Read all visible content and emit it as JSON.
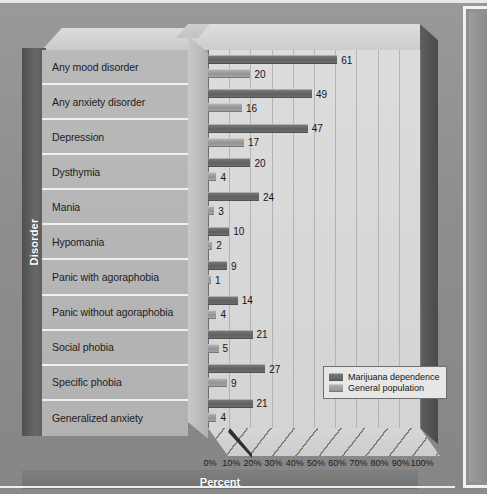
{
  "chart_data": {
    "type": "bar",
    "orientation": "horizontal",
    "title": "",
    "xlabel": "Percent",
    "ylabel": "Disorder",
    "xlim": [
      0,
      100
    ],
    "xticks": [
      "0%",
      "10%",
      "20%",
      "30%",
      "40%",
      "50%",
      "60%",
      "70%",
      "80%",
      "90%",
      "100%"
    ],
    "xtick_values": [
      0,
      10,
      20,
      30,
      40,
      50,
      60,
      70,
      80,
      90,
      100
    ],
    "grid": true,
    "legend_position": "inside-bottom-right",
    "categories": [
      "Any mood disorder",
      "Any anxiety disorder",
      "Depression",
      "Dysthymia",
      "Mania",
      "Hypomania",
      "Panic with agoraphobia",
      "Panic without agoraphobia",
      "Social phobia",
      "Specific phobia",
      "Generalized anxiety"
    ],
    "series": [
      {
        "name": "Marijuana dependence",
        "color": "#686868",
        "values": [
          61,
          49,
          47,
          20,
          24,
          10,
          9,
          14,
          21,
          27,
          21
        ]
      },
      {
        "name": "General population",
        "color": "#9c9c9c",
        "values": [
          20,
          16,
          17,
          4,
          3,
          2,
          1,
          4,
          5,
          9,
          4
        ]
      }
    ]
  },
  "axes": {
    "y_axis_title": "Disorder",
    "x_axis_title": "Percent"
  },
  "legend": {
    "entries": [
      {
        "label": "Marijuana dependence",
        "swatch": "dark-gray-swatch"
      },
      {
        "label": "General population",
        "swatch": "light-gray-swatch"
      }
    ]
  },
  "colors": {
    "series_dark": "#686868",
    "series_light": "#9c9c9c",
    "plot_background": "#d8d8d8",
    "label_panel": "#b5b5b5",
    "axis_band": "#5f5f5f",
    "page_background": "#8f8f8f"
  }
}
